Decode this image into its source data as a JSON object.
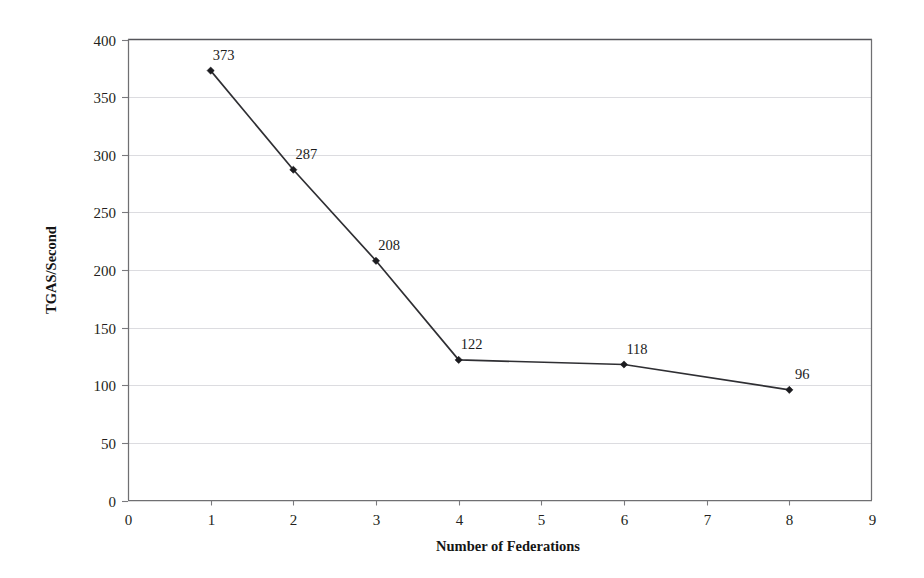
{
  "chart_data": {
    "type": "line",
    "title": "",
    "xlabel": "Number of Federations",
    "ylabel": "TGAS/Second",
    "x": [
      1,
      2,
      3,
      4,
      6,
      8
    ],
    "values": [
      373,
      287,
      208,
      122,
      118,
      96
    ],
    "point_labels": [
      "373",
      "287",
      "208",
      "122",
      "118",
      "96"
    ],
    "xlim": [
      0,
      9
    ],
    "ylim": [
      0,
      400
    ],
    "xticks": [
      0,
      1,
      2,
      3,
      4,
      5,
      6,
      7,
      8,
      9
    ],
    "xtick_labels": [
      "0",
      "1",
      "2",
      "3",
      "4",
      "5",
      "6",
      "7",
      "8",
      "9"
    ],
    "yticks": [
      0,
      50,
      100,
      150,
      200,
      250,
      300,
      350,
      400
    ],
    "ytick_labels": [
      "0",
      "50",
      "100",
      "150",
      "200",
      "250",
      "300",
      "350",
      "400"
    ],
    "grid": true,
    "grid_axis": "y",
    "legend": false,
    "series": [
      {
        "name": "TGAS/Second",
        "values": [
          373,
          287,
          208,
          122,
          118,
          96
        ],
        "marker": "diamond",
        "color": "#2f2f33"
      }
    ],
    "colors": {
      "line": "#2f2f33",
      "marker": "#1b1b1f",
      "grid": "#d8d8dc",
      "frame": "#6f6f72",
      "text": "#231f20",
      "background": "#ffffff"
    }
  }
}
